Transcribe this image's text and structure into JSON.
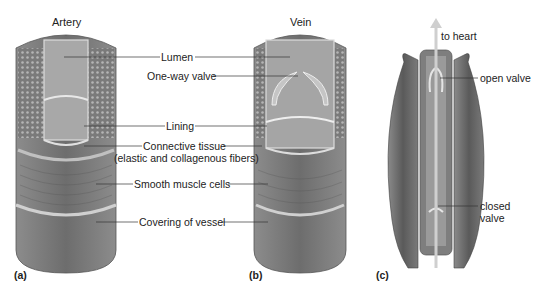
{
  "titles": {
    "artery": "Artery",
    "vein": "Vein"
  },
  "labels": {
    "lumen": "Lumen",
    "valve": "One-way valve",
    "lining": "Lining",
    "connective": "Connective tissue",
    "connective_sub": "(elastic and collagenous fibers)",
    "smooth_muscle": "Smooth muscle cells",
    "covering": "Covering of vessel"
  },
  "panel_c": {
    "to_heart": "to heart",
    "open_valve": "open valve",
    "closed_valve_1": "closed",
    "closed_valve_2": "valve"
  },
  "panels": {
    "a": "(a)",
    "b": "(b)",
    "c": "(c)"
  },
  "colors": {
    "tissue": "#8a8a8a",
    "dark": "#5e5e5e",
    "light": "#c8c8c8",
    "muscle": "#6b6b6b"
  }
}
